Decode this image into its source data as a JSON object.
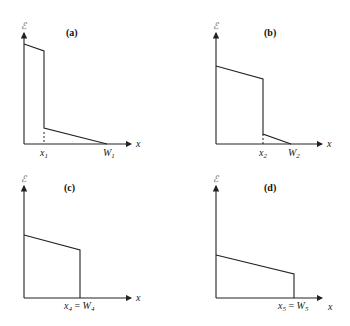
{
  "figure": {
    "y_axis_label": "ℰ",
    "x_axis_label": "x",
    "panels": [
      {
        "id": "a",
        "title": "(a)",
        "marks": [
          {
            "var": "x",
            "sub": "1"
          },
          {
            "var": "W",
            "sub": "1"
          }
        ],
        "description": "High plateau dropping sharply at x1, then low sloping segment reaching zero at W1"
      },
      {
        "id": "b",
        "title": "(b)",
        "marks": [
          {
            "var": "x",
            "sub": "2"
          },
          {
            "var": "W",
            "sub": "2"
          }
        ],
        "description": "Plateau dropping at x2, then short sloping segment reaching zero at W2"
      },
      {
        "id": "c",
        "title": "(c)",
        "marks": [
          {
            "var": "x",
            "sub": "4"
          },
          {
            "eq": " = "
          },
          {
            "var": "W",
            "sub": "4"
          }
        ],
        "description": "Sloping plateau dropping directly to zero at x4 = W4"
      },
      {
        "id": "d",
        "title": "(d)",
        "marks": [
          {
            "var": "x",
            "sub": "5"
          },
          {
            "eq": " = "
          },
          {
            "var": "W",
            "sub": "5"
          }
        ],
        "description": "Lower sloping plateau dropping directly to zero at x5 = W5"
      }
    ]
  },
  "labels": {
    "a_title": "(a)",
    "b_title": "(b)",
    "c_title": "(c)",
    "d_title": "(d)",
    "y": "ℰ",
    "x": "x",
    "a_x1": "x",
    "a_x1_sub": "1",
    "a_w1": "W",
    "a_w1_sub": "1",
    "b_x2": "x",
    "b_x2_sub": "2",
    "b_w2": "W",
    "b_w2_sub": "2",
    "c_x4": "x",
    "c_x4_sub": "4",
    "c_eq": " = ",
    "c_w4": "W",
    "c_w4_sub": "4",
    "d_x5": "x",
    "d_x5_sub": "5",
    "d_eq": " = ",
    "d_w5": "W",
    "d_w5_sub": "5"
  }
}
